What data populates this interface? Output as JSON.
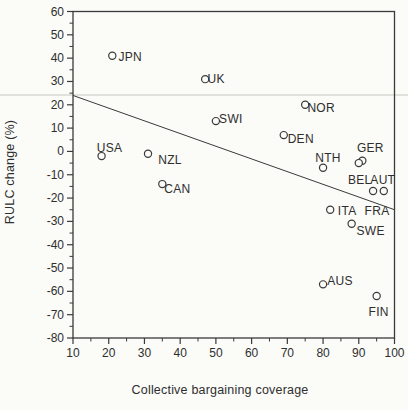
{
  "figure": {
    "background": "#fbfbf8",
    "ink_color": "#3a3a3a",
    "artifact_line_color": "#d9d9d3"
  },
  "chart_data": {
    "type": "scatter",
    "title": "",
    "xlabel": "Collective bargaining coverage",
    "ylabel": "RULC change (%)",
    "xlim": [
      10,
      100
    ],
    "ylim": [
      -80,
      60
    ],
    "x_ticks": [
      10,
      20,
      30,
      40,
      50,
      60,
      70,
      80,
      90,
      100
    ],
    "y_ticks": [
      60,
      50,
      40,
      30,
      20,
      10,
      0,
      -10,
      -20,
      -30,
      -40,
      -50,
      -60,
      -70,
      -80
    ],
    "minor_tick_step": 5,
    "grid": false,
    "legend": "none",
    "marker": "open-circle",
    "points": [
      {
        "label": "USA",
        "x": 18,
        "y": -2,
        "label_dx": 8,
        "label_dy": -8
      },
      {
        "label": "JPN",
        "x": 21,
        "y": 41,
        "label_dx": 18,
        "label_dy": 1
      },
      {
        "label": "NZL",
        "x": 31,
        "y": -1,
        "label_dx": 22,
        "label_dy": 6
      },
      {
        "label": "CAN",
        "x": 35,
        "y": -14,
        "label_dx": 15,
        "label_dy": 5
      },
      {
        "label": "UK",
        "x": 47,
        "y": 31,
        "label_dx": 11,
        "label_dy": 0
      },
      {
        "label": "SWI",
        "x": 50,
        "y": 13,
        "label_dx": 15,
        "label_dy": -2
      },
      {
        "label": "DEN",
        "x": 69,
        "y": 7,
        "label_dx": 17,
        "label_dy": 4
      },
      {
        "label": "NOR",
        "x": 75,
        "y": 20,
        "label_dx": 16,
        "label_dy": 3
      },
      {
        "label": "NTH",
        "x": 80,
        "y": -7,
        "label_dx": 5,
        "label_dy": -10
      },
      {
        "label": "GER",
        "x": 91,
        "y": -4,
        "label_dx": 8,
        "label_dy": -13
      },
      {
        "label": "BEL",
        "x": 90,
        "y": -5,
        "label_dx": 1,
        "label_dy": 17
      },
      {
        "label": "AUT",
        "x": 97,
        "y": -17,
        "label_dx": -1,
        "label_dy": -11
      },
      {
        "label": "FRA",
        "x": 94,
        "y": -17,
        "label_dx": 4,
        "label_dy": 20
      },
      {
        "label": "ITA",
        "x": 82,
        "y": -25,
        "label_dx": 17,
        "label_dy": 1
      },
      {
        "label": "SWE",
        "x": 88,
        "y": -31,
        "label_dx": 19,
        "label_dy": 7
      },
      {
        "label": "AUS",
        "x": 80,
        "y": -57,
        "label_dx": 17,
        "label_dy": -3
      },
      {
        "label": "FIN",
        "x": 95,
        "y": -62,
        "label_dx": 2,
        "label_dy": 16
      }
    ],
    "trend_line": {
      "x1": 10,
      "y1": 24,
      "x2": 100,
      "y2": -25
    },
    "scan_artifact_line_y_px": 95
  }
}
